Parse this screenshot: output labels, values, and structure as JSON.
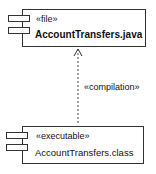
{
  "components": [
    {
      "stereotype": "«file»",
      "name": "AccountTransfers.java"
    },
    {
      "stereotype": "«executable»",
      "name": "AccountTransfers.class"
    }
  ],
  "dependency": {
    "label": "«compilation»",
    "from": "AccountTransfers.class",
    "to": "AccountTransfers.java"
  }
}
